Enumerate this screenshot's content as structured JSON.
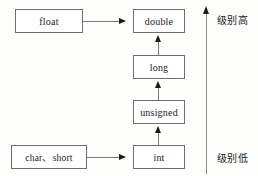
{
  "diagram": {
    "colors": {
      "background": "#fdfdfc",
      "box_border": "#6e6e6e",
      "box_fill": "#ffffff",
      "line": "#7a7a7a",
      "arrow": "#1a1a1a",
      "text": "#1a1a1a"
    },
    "nodes": {
      "float": "float",
      "double": "double",
      "long": "long",
      "unsigned": "unsigned",
      "int": "int",
      "char_short": "char、short"
    },
    "axis": {
      "label_high": "级别高",
      "label_low": "级别低"
    }
  }
}
